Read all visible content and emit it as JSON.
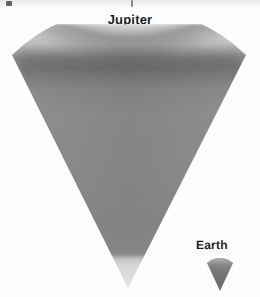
{
  "figure": {
    "type": "scale-comparison-diagram",
    "background_color": "#ffffff",
    "width": 260,
    "height": 297
  },
  "labels": {
    "jupiter": "Jupiter",
    "earth": "Earth"
  },
  "bodies": [
    {
      "name": "Jupiter",
      "shape": "wedge",
      "label": "Jupiter",
      "apex": {
        "x": 128,
        "y": 288
      },
      "arc_top_y": 32,
      "arc_left_x": 12,
      "arc_right_x": 246,
      "layers": [
        {
          "name": "upper-haze-band",
          "color": "#d3d3d3",
          "from_y": 32,
          "to_y": 48
        },
        {
          "name": "dark-cloud-band",
          "color": "#6f6f6f",
          "from_y": 48,
          "to_y": 74
        },
        {
          "name": "mid-interior",
          "color": "#8b8b8b",
          "from_y": 74,
          "to_y": 255
        },
        {
          "name": "lower-core-glow",
          "color": "#dcdcdc",
          "from_y": 255,
          "to_y": 288
        }
      ]
    },
    {
      "name": "Earth",
      "shape": "wedge",
      "label": "Earth",
      "apex": {
        "x": 220,
        "y": 291
      },
      "arc_top_y": 262,
      "arc_left_x": 207,
      "arc_right_x": 233,
      "layers": [
        {
          "name": "earth-crust-band",
          "color": "#8d8d8d",
          "from_y": 262,
          "to_y": 268
        },
        {
          "name": "earth-interior",
          "color": "#757575",
          "from_y": 268,
          "to_y": 291
        }
      ]
    }
  ],
  "colors": {
    "page_background": "#ffffff",
    "label_text": "#1d1d1d",
    "light_band": "#d3d3d3",
    "dark_band": "#6f6f6f",
    "mid_gray": "#8b8b8b",
    "pale_tip": "#dcdcdc",
    "earth_gray": "#787878"
  },
  "artifacts": [
    {
      "name": "scan-mark-left",
      "x": 6,
      "y": 1
    },
    {
      "name": "scan-mark-center",
      "x": 131,
      "y": 0
    }
  ]
}
